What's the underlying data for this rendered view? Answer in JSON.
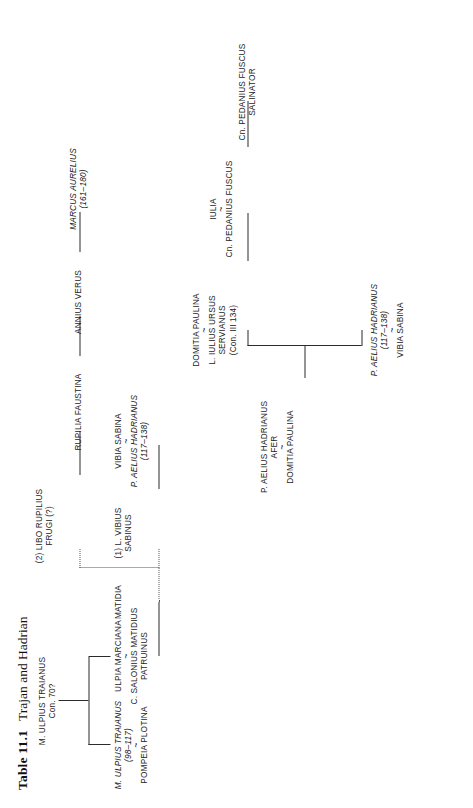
{
  "title": {
    "number": "Table 11.1",
    "caption": "Trajan and Hadrian"
  },
  "diagram": {
    "type": "genealogical-tree",
    "orientation": "rotated-90-ccw",
    "marriage_symbol": "~",
    "line_color": "#2b2b2b",
    "dotted_line_color": "#555555",
    "background": "#ffffff"
  },
  "nodes": {
    "trajan_father": {
      "line1": "M. ULPIUS TRAIANUS",
      "line2": "Con. 70?"
    },
    "trajan": {
      "line1": "M. ULPIUS TRAIANUS",
      "line2": "(98–117)",
      "spouse": "POMPEIA PLOTINA"
    },
    "marciana": {
      "line1": "ULPIA MARCIANA",
      "spouse1": "C. SALONIUS MATIDIUS",
      "spouse2": "PATRUINUS"
    },
    "matidia": {
      "line1": "MATIDIA"
    },
    "sabinus": {
      "line1": "(1) L. VIBIUS",
      "line2": "SABINUS"
    },
    "libo": {
      "line1": "(2) LIBO RUPILIUS",
      "line2": "FRUGI (?)"
    },
    "vibia_sabina": {
      "line1": "VIBIA SABINA",
      "spouse1": "P. AELIUS HADRIANUS",
      "spouse2": "(117–138)"
    },
    "rupilia": {
      "line1": "RUPILIA FAUSTINA"
    },
    "annius_verus": {
      "line1": "ANNIUS VERUS"
    },
    "marcus_aurelius": {
      "line1": "MARCUS AURELIUS",
      "line2": "(161–180)"
    },
    "hadrianus_afer": {
      "line1": "P. AELIUS HADRIANUS",
      "line2": "AFER",
      "spouse": "DOMITIA PAULINA"
    },
    "hadrian": {
      "line1": "P. AELIUS HADRIANUS",
      "line2": "(117–138)",
      "spouse": "VIBIA SABINA"
    },
    "domitia_paulina": {
      "line1": "DOMITIA PAULINA",
      "spouse1": "L. IULIUS URSUS",
      "spouse2": "SERVIANUS",
      "spouse3": "(Con. III 134)"
    },
    "iulia": {
      "line1": "IULIA",
      "spouse": "Cn. PEDANIUS FUSCUS"
    },
    "salinator": {
      "line1": "Cn. PEDANIUS FUSCUS",
      "line2": "SALINATOR"
    }
  }
}
